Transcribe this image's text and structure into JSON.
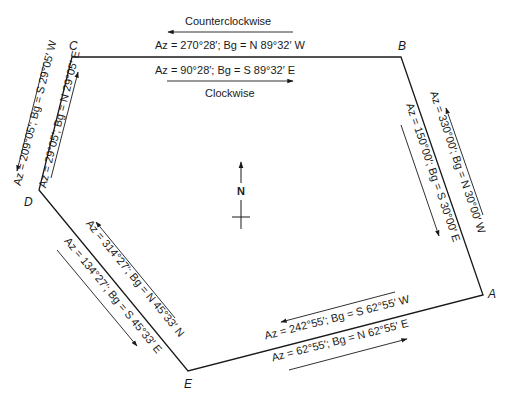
{
  "vertices": {
    "A": {
      "label": "A",
      "x": 483,
      "y": 295
    },
    "B": {
      "label": "B",
      "x": 401,
      "y": 57
    },
    "C": {
      "label": "C",
      "x": 72,
      "y": 57
    },
    "D": {
      "label": "D",
      "x": 39,
      "y": 190
    },
    "E": {
      "label": "E",
      "x": 188,
      "y": 371
    }
  },
  "north_arrow": {
    "label": "N"
  },
  "direction_labels": {
    "counterclockwise": "Counterclockwise",
    "clockwise": "Clockwise"
  },
  "sides": {
    "BC": {
      "counterclockwise": "Az = 270°28′; Bg = N 89°32′ W",
      "clockwise": "Az = 90°28′; Bg = S 89°32′ E"
    },
    "CD": {
      "counterclockwise": "Az = 209°05′; Bg = S 29°05′ W",
      "clockwise": "Az = 29°05′; Bg = N 29°05′ E"
    },
    "AB": {
      "counterclockwise": "Az = 330°00′; Bg = N 30°00′ W",
      "clockwise": "Az = 150°00′; Bg = S 30°00′ E"
    },
    "DE": {
      "counterclockwise": "Az = 314°27′; Bg = N 45°33′ N",
      "clockwise": "Az = 134°27′; Bg = S 45°33′ E"
    },
    "EA": {
      "counterclockwise": "Az = 242°55′; Bg = S 62°55′ W",
      "clockwise": "Az = 62°55′; Bg = N 62°55′ E"
    }
  }
}
